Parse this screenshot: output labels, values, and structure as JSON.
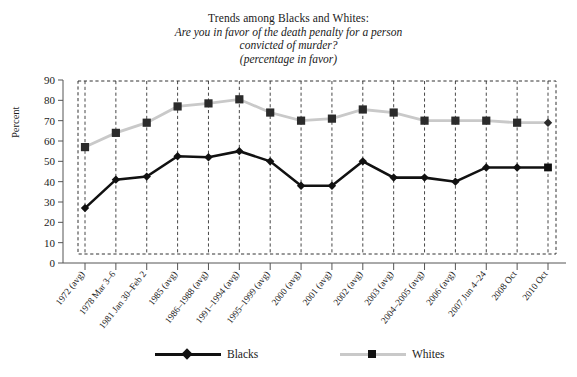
{
  "title": {
    "line1": "Trends among Blacks and Whites:",
    "line2": "Are you in favor of the death penalty for a person",
    "line3": "convicted of murder?",
    "line4": "(percentage in favor)"
  },
  "axes": {
    "ylabel": "Percent",
    "yticks": [
      "0",
      "10",
      "20",
      "30",
      "40",
      "50",
      "60",
      "70",
      "80",
      "90"
    ]
  },
  "legend": {
    "blacks": "Blacks",
    "whites": "Whites"
  },
  "colors": {
    "blacks_line": "#111111",
    "whites_line": "#c9c9c9",
    "grid": "#333333",
    "axis": "#555555",
    "background": "#ffffff"
  },
  "chart_data": {
    "type": "line",
    "title": "Trends among Blacks and Whites: Are you in favor of the death penalty for a person convicted of murder? (percentage in favor)",
    "xlabel": "",
    "ylabel": "Percent",
    "ylim": [
      0,
      90
    ],
    "ytick_step": 10,
    "grid": "vertical-dashed",
    "legend_position": "bottom",
    "categories": [
      "1972 (avg)",
      "1978 Mar 3–6",
      "1981 Jan 30–Feb 2",
      "1985 (avg)",
      "1986–1988 (avg)",
      "1991–1994 (avg)",
      "1995–1999 (avg)",
      "2000 (avg)",
      "2001 (avg)",
      "2002 (avg)",
      "2003 (avg)",
      "2004–2005 (avg)",
      "2006 (avg)",
      "2007 Jun 4–24",
      "2008 Oct",
      "2010 Oct"
    ],
    "series": [
      {
        "name": "Blacks",
        "marker": "diamond",
        "color": "#111111",
        "values": [
          27,
          41,
          42.5,
          52.5,
          52,
          55,
          50,
          38,
          38,
          50,
          42,
          42,
          40,
          47,
          47,
          47
        ]
      },
      {
        "name": "Whites",
        "marker": "square",
        "color": "#c9c9c9",
        "values": [
          57,
          64,
          69,
          77,
          78.5,
          80.5,
          74,
          70,
          71,
          75.5,
          74,
          70,
          70,
          70,
          69,
          69
        ]
      }
    ]
  }
}
